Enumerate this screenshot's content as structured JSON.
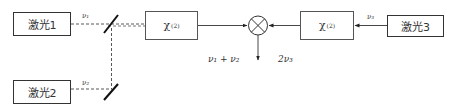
{
  "diagram": {
    "type": "optical-frequency-mixing-setup",
    "nodes": {
      "laser1": {
        "label": "激光1"
      },
      "laser2": {
        "label": "激光2"
      },
      "laser3": {
        "label": "激光3"
      },
      "chi1": {
        "symbol": "χ",
        "order": "(2)"
      },
      "chi2": {
        "symbol": "χ",
        "order": "(2)"
      },
      "mixer": {
        "symbol": "⊗"
      }
    },
    "labels": {
      "nu1": "ν₁",
      "nu2": "ν₂",
      "nu3": "ν₃",
      "sum": "ν₁ + ν₂",
      "double": "2ν₃"
    },
    "edges": [
      {
        "from": "laser1",
        "to": "chi1",
        "label": "ν₁",
        "style": "dashed"
      },
      {
        "from": "laser2",
        "to": "chi1",
        "label": "ν₂",
        "style": "dashed",
        "via": "mirrors"
      },
      {
        "from": "chi1",
        "to": "mixer",
        "label": "ν₁ + ν₂",
        "style": "solid-arrow"
      },
      {
        "from": "laser3",
        "to": "chi2",
        "label": "ν₃",
        "style": "solid-arrow"
      },
      {
        "from": "chi2",
        "to": "mixer",
        "label": "2ν₃",
        "style": "solid-arrow"
      },
      {
        "from": "mixer",
        "to": "output",
        "style": "solid-arrow"
      }
    ]
  }
}
